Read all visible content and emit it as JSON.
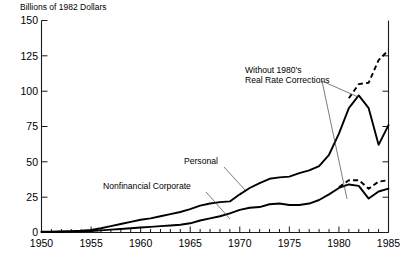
{
  "chart_data": {
    "type": "line",
    "title": "",
    "axis_title": "Billions of 1982 Dollars",
    "xlabel": "",
    "ylabel": "Billions of 1982 Dollars",
    "xlim": [
      1950,
      1985
    ],
    "ylim": [
      0,
      150
    ],
    "yticks": [
      0,
      25,
      50,
      75,
      100,
      125,
      150
    ],
    "ytick_labels": [
      "0",
      "25",
      "50",
      "75",
      "100",
      "125",
      "150"
    ],
    "xticks": [
      1950,
      1955,
      1960,
      1965,
      1970,
      1975,
      1980,
      1985
    ],
    "xtick_labels": [
      "1950",
      "1955",
      "1960",
      "1965",
      "1970",
      "1975",
      "1980",
      "1985"
    ],
    "x_minor_tick_interval": 1,
    "grid": false,
    "legend": "inline-labels",
    "x": [
      1950,
      1951,
      1952,
      1953,
      1954,
      1955,
      1956,
      1957,
      1958,
      1959,
      1960,
      1961,
      1962,
      1963,
      1964,
      1965,
      1966,
      1967,
      1968,
      1969,
      1970,
      1971,
      1972,
      1973,
      1974,
      1975,
      1976,
      1977,
      1978,
      1979,
      1980,
      1981,
      1982,
      1983,
      1984,
      1985
    ],
    "series": [
      {
        "name": "Personal",
        "style": "solid",
        "label": "Personal",
        "values": [
          0.5,
          0.6,
          0.8,
          1.0,
          1.3,
          1.8,
          3.0,
          4.5,
          6.0,
          7.5,
          9.0,
          10.0,
          11.5,
          13.0,
          14.5,
          16.5,
          19.0,
          20.5,
          21.5,
          22.0,
          27.0,
          31.5,
          35.0,
          38.0,
          39.0,
          39.5,
          42.0,
          44.0,
          47.0,
          55.0,
          70.0,
          88.0,
          97.0,
          88.0,
          62.0,
          76.0
        ]
      },
      {
        "name": "Personal Without 1980's Real Rate Corrections",
        "style": "dashed",
        "label": "Without 1980's Real Rate Corrections",
        "values": [
          null,
          null,
          null,
          null,
          null,
          null,
          null,
          null,
          null,
          null,
          null,
          null,
          null,
          null,
          null,
          null,
          null,
          null,
          null,
          null,
          null,
          null,
          null,
          null,
          null,
          null,
          null,
          null,
          null,
          null,
          null,
          95.0,
          105.0,
          106.0,
          122.0,
          129.0
        ]
      },
      {
        "name": "Nonfinancial Corporate",
        "style": "solid",
        "label": "Nonfinancial Corporate",
        "values": [
          0.3,
          0.4,
          0.5,
          0.6,
          0.8,
          1.0,
          1.5,
          2.0,
          2.5,
          3.0,
          3.5,
          4.0,
          4.5,
          5.0,
          5.5,
          6.5,
          8.5,
          10.0,
          11.5,
          13.5,
          16.0,
          17.5,
          18.0,
          20.0,
          20.5,
          19.5,
          19.5,
          20.5,
          23.0,
          27.0,
          31.5,
          34.0,
          33.0,
          24.0,
          29.0,
          31.0
        ]
      },
      {
        "name": "Nonfinancial Corporate Without 1980's Real Rate Corrections",
        "style": "dashed",
        "label": "Without 1980's Real Rate Corrections",
        "values": [
          null,
          null,
          null,
          null,
          null,
          null,
          null,
          null,
          null,
          null,
          null,
          null,
          null,
          null,
          null,
          null,
          null,
          null,
          null,
          null,
          null,
          null,
          null,
          null,
          null,
          null,
          null,
          null,
          null,
          null,
          32.0,
          37.0,
          37.0,
          31.0,
          36.0,
          37.0
        ]
      }
    ],
    "annotations": [
      {
        "text_line1": "Without 1980's",
        "text_line2": "Real Rate Corrections",
        "x": 245,
        "y": 72
      },
      {
        "text": "Personal",
        "x": 184,
        "y": 163
      },
      {
        "text": "Nonfinancial Corporate",
        "x": 103,
        "y": 188
      }
    ]
  }
}
